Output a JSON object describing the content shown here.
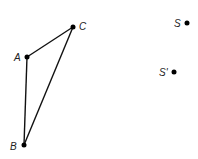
{
  "diagram": {
    "points": [
      {
        "id": "A",
        "label": "A"
      },
      {
        "id": "B",
        "label": "B"
      },
      {
        "id": "C",
        "label": "C"
      },
      {
        "id": "S",
        "label": "S"
      },
      {
        "id": "Sp",
        "label": "S'"
      }
    ],
    "segments": [
      [
        "A",
        "C"
      ],
      [
        "A",
        "B"
      ],
      [
        "B",
        "C"
      ]
    ]
  }
}
